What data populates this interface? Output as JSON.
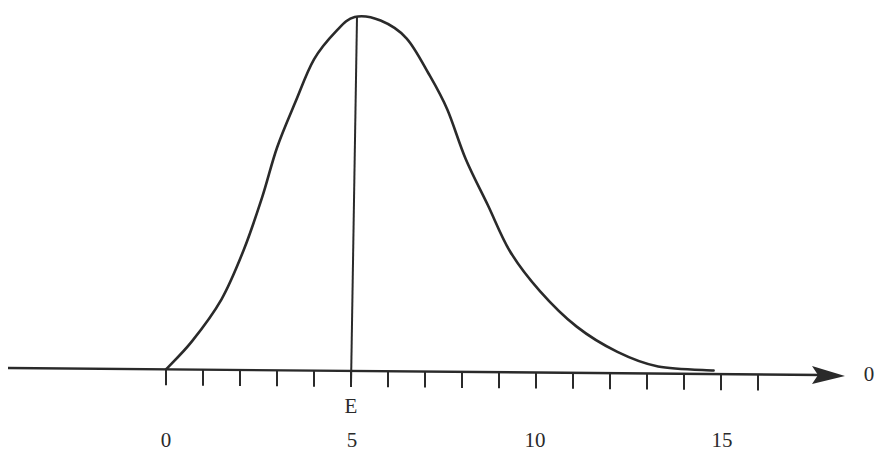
{
  "chart_data": {
    "type": "line",
    "title": "",
    "xlabel": "",
    "ylabel": "",
    "axis_end_label": "0",
    "mean_marker_label": "E",
    "mean_marker_x": 5,
    "x_tick_labels": [
      "0",
      "5",
      "10",
      "15"
    ],
    "x_tick_label_values": [
      0,
      5,
      10,
      15
    ],
    "minor_tick_count": 17,
    "xlim": [
      -4.3,
      18
    ],
    "grid": false,
    "legend": null,
    "series": [
      {
        "name": "density",
        "x": [
          0.0,
          0.7,
          1.5,
          2.1,
          2.6,
          3.0,
          3.5,
          4.0,
          4.6,
          5.1,
          5.8,
          6.5,
          7.1,
          7.6,
          8.1,
          8.7,
          9.3,
          10.1,
          11.1,
          12.2,
          13.3,
          14.8
        ],
        "y": [
          0.0,
          0.08,
          0.2,
          0.34,
          0.49,
          0.63,
          0.76,
          0.88,
          0.96,
          1.0,
          0.99,
          0.94,
          0.84,
          0.74,
          0.6,
          0.47,
          0.34,
          0.23,
          0.13,
          0.06,
          0.02,
          0.01
        ]
      }
    ]
  }
}
